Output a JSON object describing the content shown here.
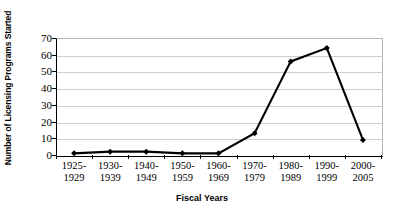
{
  "chart_data": {
    "type": "line",
    "title": "",
    "xlabel": "Fiscal Years",
    "ylabel": "Number of Licensing Programs Started",
    "categories": [
      "1925-1929",
      "1930-1939",
      "1940-1949",
      "1950-1959",
      "1960-1969",
      "1970-1979",
      "1980-1989",
      "1990-1999",
      "2000-2005"
    ],
    "category_lines": [
      [
        "1925-",
        "1929"
      ],
      [
        "1930-",
        "1939"
      ],
      [
        "1940-",
        "1949"
      ],
      [
        "1950-",
        "1959"
      ],
      [
        "1960-",
        "1969"
      ],
      [
        "1970-",
        "1979"
      ],
      [
        "1980-",
        "1989"
      ],
      [
        "1990-",
        "1999"
      ],
      [
        "2000-",
        "2005"
      ]
    ],
    "values": [
      1,
      2,
      2,
      1,
      1,
      13,
      56,
      64,
      9
    ],
    "ylim": [
      0,
      70
    ],
    "yticks": [
      0,
      10,
      20,
      30,
      40,
      50,
      60,
      70
    ],
    "ytick_labels": [
      "0",
      "10",
      "20",
      "30",
      "40",
      "50",
      "60",
      "70"
    ],
    "grid": "horizontal",
    "legend": "none",
    "series_color": "#000000",
    "gridline_color": "#cfcfcf",
    "axis_color": "#000000",
    "plot_border_color": "#b6b6b6",
    "marker": "diamond"
  }
}
